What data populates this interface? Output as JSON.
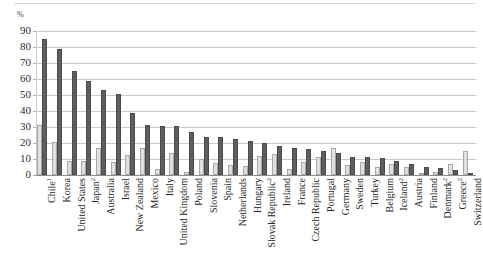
{
  "chart_data": {
    "type": "bar",
    "title": "",
    "subtitle": "",
    "xlabel": "",
    "ylabel": "%",
    "ylim": [
      0,
      90
    ],
    "yticks": [
      0,
      10,
      20,
      30,
      40,
      50,
      60,
      70,
      80,
      90
    ],
    "grid": true,
    "legend_position": "none",
    "categories": [
      "Chile",
      "Korea",
      "United States",
      "Japan",
      "Australia",
      "Israel",
      "New Zealand",
      "Mexico",
      "Italy",
      "United Kingdom",
      "Poland",
      "Slovenia",
      "Spain",
      "Netherlands",
      "Hungary",
      "Slovak Republic",
      "Ireland",
      "France",
      "Czech Republic",
      "Portugal",
      "Germany",
      "Sweden",
      "Turkey",
      "Belgium",
      "Iceland",
      "Austria",
      "Finland",
      "Denmark",
      "Greece",
      "Switzerland"
    ],
    "category_footnotes": [
      "1",
      "",
      "",
      "2",
      "",
      "",
      "",
      "",
      "",
      "",
      "",
      "",
      "",
      "",
      "",
      "2",
      "",
      "",
      "",
      "",
      "",
      "",
      "",
      "",
      "2",
      "",
      "",
      "2",
      "2",
      ""
    ],
    "series": [
      {
        "name": "light-series",
        "color": "#e0e0e0",
        "values": [
          31,
          20.5,
          9,
          8.5,
          17,
          8,
          12.5,
          17,
          4,
          13.5,
          2,
          10,
          7.5,
          6,
          5.5,
          12,
          13,
          3.5,
          8,
          11,
          17,
          6,
          8,
          5,
          7,
          5,
          1.5,
          2,
          7,
          15
        ]
      },
      {
        "name": "dark-series",
        "color": "#5e5e5e",
        "values": [
          85,
          79,
          65,
          59,
          53,
          50.5,
          39,
          31,
          30.5,
          30.5,
          27,
          24,
          24,
          22.5,
          21,
          20,
          18,
          17,
          16.5,
          15,
          14,
          11,
          11,
          10.5,
          9,
          7,
          5,
          4.5,
          3,
          0
        ]
      }
    ]
  },
  "axis": {
    "unit_label": "%"
  }
}
